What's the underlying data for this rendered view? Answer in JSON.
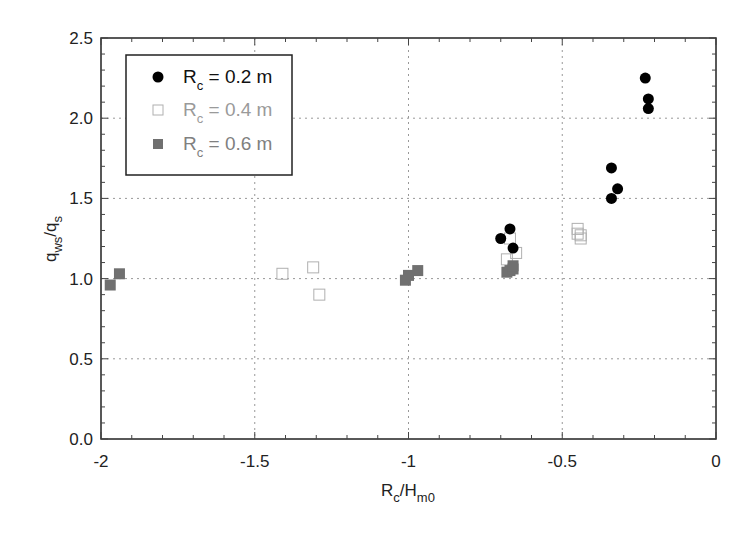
{
  "chart_data": {
    "type": "scatter",
    "title": "",
    "xlabel": "R_c/H_m0",
    "xlabel_parts": {
      "main": "R",
      "sub": "c",
      "mid": "/H",
      "sub2": "m0"
    },
    "ylabel": "q_ws/q_s",
    "ylabel_parts": {
      "main": "q",
      "sub": "ws",
      "mid": "/q",
      "sub2": "s"
    },
    "xlim": [
      -2,
      0
    ],
    "ylim": [
      0,
      2.5
    ],
    "xticks": [
      -2,
      -1.5,
      -1,
      -0.5,
      0
    ],
    "xtick_labels": [
      "-2",
      "-1.5",
      "-1",
      "-0.5",
      "0"
    ],
    "yticks": [
      0,
      0.5,
      1.0,
      1.5,
      2.0,
      2.5
    ],
    "ytick_labels": [
      "0.0",
      "0.5",
      "1.0",
      "1.5",
      "2.0",
      "2.5"
    ],
    "grid": "dotted at major ticks",
    "legend_position": "upper left",
    "series": [
      {
        "name": "R_c = 0.2 m",
        "label_main": "R",
        "label_sub": "c",
        "label_rest": " = 0.2 m",
        "marker": "filled-circle",
        "color": "#000000",
        "points": [
          {
            "x": -0.7,
            "y": 1.25
          },
          {
            "x": -0.67,
            "y": 1.31
          },
          {
            "x": -0.66,
            "y": 1.19
          },
          {
            "x": -0.34,
            "y": 1.69
          },
          {
            "x": -0.32,
            "y": 1.56
          },
          {
            "x": -0.34,
            "y": 1.5
          },
          {
            "x": -0.23,
            "y": 2.25
          },
          {
            "x": -0.22,
            "y": 2.12
          },
          {
            "x": -0.22,
            "y": 2.06
          }
        ]
      },
      {
        "name": "R_c = 0.4 m",
        "label_main": "R",
        "label_sub": "c",
        "label_rest": " = 0.4 m",
        "marker": "open-square",
        "color": "#b0b0b0",
        "points": [
          {
            "x": -1.41,
            "y": 1.03
          },
          {
            "x": -1.31,
            "y": 1.07
          },
          {
            "x": -1.29,
            "y": 0.9
          },
          {
            "x": -0.67,
            "y": 1.25
          },
          {
            "x": -0.68,
            "y": 1.12
          },
          {
            "x": -0.65,
            "y": 1.16
          },
          {
            "x": -0.45,
            "y": 1.31
          },
          {
            "x": -0.44,
            "y": 1.27
          },
          {
            "x": -0.45,
            "y": 1.28
          },
          {
            "x": -0.44,
            "y": 1.25
          }
        ]
      },
      {
        "name": "R_c = 0.6 m",
        "label_main": "R",
        "label_sub": "c",
        "label_rest": " = 0.6 m",
        "marker": "filled-square",
        "color": "#707070",
        "points": [
          {
            "x": -1.97,
            "y": 0.96
          },
          {
            "x": -1.94,
            "y": 1.03
          },
          {
            "x": -1.01,
            "y": 0.99
          },
          {
            "x": -1.0,
            "y": 1.02
          },
          {
            "x": -0.97,
            "y": 1.05
          },
          {
            "x": -0.68,
            "y": 1.04
          },
          {
            "x": -0.67,
            "y": 1.05
          },
          {
            "x": -0.66,
            "y": 1.06
          },
          {
            "x": -0.66,
            "y": 1.08
          }
        ]
      }
    ]
  },
  "legend": {
    "items": [
      {
        "main": "R",
        "sub": "c",
        "rest": " = 0.2 m"
      },
      {
        "main": "R",
        "sub": "c",
        "rest": " = 0.4 m"
      },
      {
        "main": "R",
        "sub": "c",
        "rest": " = 0.6 m"
      }
    ]
  }
}
